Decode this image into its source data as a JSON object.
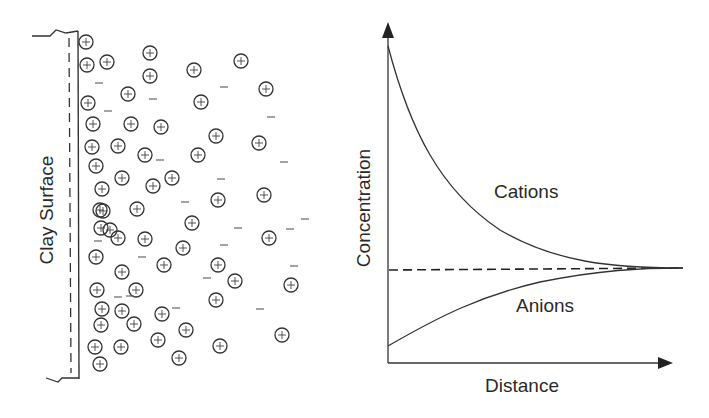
{
  "left_panel": {
    "wall_label": "Clay Surface",
    "cation_symbol": "+",
    "anion_symbol": "−",
    "cations": [
      [
        86,
        42
      ],
      [
        87,
        65
      ],
      [
        107,
        62
      ],
      [
        150,
        53
      ],
      [
        150,
        76
      ],
      [
        194,
        70
      ],
      [
        241,
        61
      ],
      [
        266,
        89
      ],
      [
        128,
        94
      ],
      [
        88,
        103
      ],
      [
        201,
        102
      ],
      [
        93,
        124
      ],
      [
        131,
        124
      ],
      [
        161,
        127
      ],
      [
        216,
        136
      ],
      [
        259,
        143
      ],
      [
        92,
        147
      ],
      [
        118,
        146
      ],
      [
        145,
        155
      ],
      [
        198,
        155
      ],
      [
        96,
        166
      ],
      [
        172,
        178
      ],
      [
        102,
        189
      ],
      [
        122,
        178
      ],
      [
        153,
        186
      ],
      [
        264,
        195
      ],
      [
        103,
        211
      ],
      [
        137,
        209
      ],
      [
        192,
        223
      ],
      [
        218,
        200
      ],
      [
        101,
        228
      ],
      [
        100,
        210
      ],
      [
        145,
        239
      ],
      [
        118,
        238
      ],
      [
        183,
        248
      ],
      [
        269,
        238
      ],
      [
        96,
        257
      ],
      [
        122,
        272
      ],
      [
        164,
        265
      ],
      [
        218,
        265
      ],
      [
        235,
        281
      ],
      [
        97,
        290
      ],
      [
        136,
        290
      ],
      [
        291,
        285
      ],
      [
        102,
        309
      ],
      [
        122,
        311
      ],
      [
        162,
        314
      ],
      [
        101,
        325
      ],
      [
        134,
        324
      ],
      [
        216,
        300
      ],
      [
        186,
        330
      ],
      [
        95,
        347
      ],
      [
        121,
        347
      ],
      [
        158,
        340
      ],
      [
        179,
        358
      ],
      [
        220,
        346
      ],
      [
        282,
        335
      ],
      [
        100,
        364
      ],
      [
        110,
        230
      ]
    ],
    "anions": [
      [
        99,
        83
      ],
      [
        153,
        99
      ],
      [
        224,
        87
      ],
      [
        271,
        117
      ],
      [
        108,
        111
      ],
      [
        160,
        160
      ],
      [
        221,
        179
      ],
      [
        284,
        162
      ],
      [
        185,
        202
      ],
      [
        98,
        241
      ],
      [
        142,
        257
      ],
      [
        207,
        278
      ],
      [
        238,
        228
      ],
      [
        294,
        266
      ],
      [
        305,
        219
      ],
      [
        260,
        309
      ],
      [
        176,
        308
      ],
      [
        290,
        229
      ],
      [
        118,
        297
      ],
      [
        130,
        296
      ],
      [
        224,
        245
      ]
    ]
  },
  "chart_data": {
    "type": "line",
    "title": "",
    "xlabel": "Distance",
    "ylabel": "Concentration",
    "grid": false,
    "legend": "inline labels",
    "x": [
      0,
      0.1,
      0.2,
      0.3,
      0.4,
      0.5,
      0.6,
      0.7,
      0.8,
      0.9,
      1.0
    ],
    "series": [
      {
        "name": "Cations",
        "values": [
          1.0,
          0.72,
          0.52,
          0.37,
          0.26,
          0.18,
          0.12,
          0.07,
          0.03,
          0.01,
          0.0
        ]
      },
      {
        "name": "Anions",
        "values": [
          -0.42,
          -0.31,
          -0.23,
          -0.16,
          -0.11,
          -0.07,
          -0.045,
          -0.025,
          -0.01,
          -0.003,
          0.0
        ]
      },
      {
        "name": "Bulk concentration (dashed)",
        "values": [
          0,
          0,
          0,
          0,
          0,
          0,
          0,
          0,
          0,
          0,
          0
        ]
      }
    ],
    "annotations": [
      "Cations",
      "Anions"
    ]
  },
  "right_panel": {
    "y_axis_label": "Concentration",
    "x_axis_label": "Distance",
    "cations_label": "Cations",
    "anions_label": "Anions"
  }
}
